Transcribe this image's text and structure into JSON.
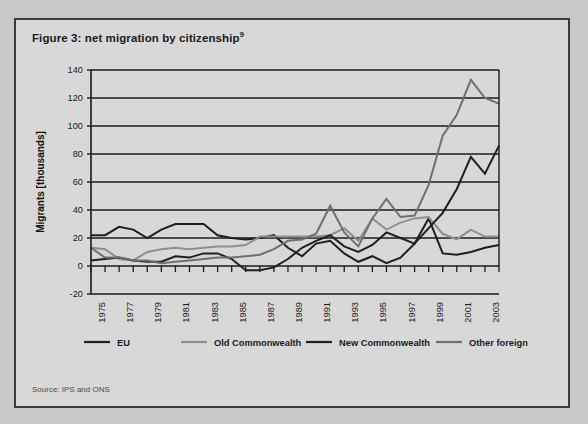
{
  "figure": {
    "title": "Figure 3: net migration by citizenship",
    "title_superscript": "9",
    "source": "Source: IPS and ONS"
  },
  "chart_data": {
    "type": "line",
    "title": "Figure 3: net migration by citizenship",
    "xlabel": "",
    "ylabel": "Migrants [thousands]",
    "ylim": [
      -20,
      140
    ],
    "yticks": [
      -20,
      0,
      20,
      40,
      60,
      80,
      100,
      120,
      140
    ],
    "ytick_labels": [
      "-20",
      "0",
      "20",
      "40",
      "60",
      "80",
      "100",
      "120",
      "140"
    ],
    "xlim": [
      1974,
      2003
    ],
    "x": [
      1974,
      1975,
      1976,
      1977,
      1978,
      1979,
      1980,
      1981,
      1982,
      1983,
      1984,
      1985,
      1986,
      1987,
      1988,
      1989,
      1990,
      1991,
      1992,
      1993,
      1994,
      1995,
      1996,
      1997,
      1998,
      1999,
      2000,
      2001,
      2002,
      2003
    ],
    "xtick_labels": [
      "1975",
      "1977",
      "1979",
      "1981",
      "1983",
      "1985",
      "1987",
      "1989",
      "1991",
      "1993",
      "1995",
      "1997",
      "1999",
      "2001",
      "2003"
    ],
    "xticks": [
      1975,
      1977,
      1979,
      1981,
      1983,
      1985,
      1987,
      1989,
      1991,
      1993,
      1995,
      1997,
      1999,
      2001,
      2003
    ],
    "grid": true,
    "grid_axis": "y",
    "legend_position": "bottom",
    "series": [
      {
        "name": "EU",
        "color": "#1f1f1f",
        "width": 2.0,
        "values": [
          22,
          22,
          28,
          26,
          20,
          26,
          30,
          30,
          30,
          22,
          20,
          19,
          20,
          22,
          13,
          7,
          16,
          18,
          9,
          3,
          7,
          2,
          6,
          16,
          34,
          9,
          8,
          10,
          13,
          15
        ]
      },
      {
        "name": "Old Commonwealth",
        "color": "#8f8f8f",
        "width": 2.0,
        "values": [
          13,
          12,
          5,
          4,
          10,
          12,
          13,
          12,
          13,
          14,
          14,
          15,
          21,
          21,
          21,
          21,
          21,
          22,
          27,
          18,
          34,
          26,
          31,
          34,
          35,
          23,
          19,
          26,
          21,
          21
        ]
      },
      {
        "name": "New Commonwealth",
        "color": "#1f1f1f",
        "width": 2.0,
        "values": [
          4,
          5,
          6,
          4,
          3,
          3,
          7,
          6,
          9,
          9,
          5,
          -3,
          -3,
          -1,
          5,
          13,
          18,
          22,
          14,
          10,
          15,
          24,
          20,
          16,
          27,
          38,
          55,
          78,
          66,
          86
        ]
      },
      {
        "name": "Other foreign",
        "color": "#6f6f6f",
        "width": 2.0,
        "values": [
          13,
          6,
          6,
          4,
          4,
          2,
          3,
          4,
          5,
          6,
          6,
          7,
          8,
          12,
          18,
          19,
          23,
          43,
          24,
          14,
          34,
          48,
          35,
          36,
          58,
          93,
          108,
          133,
          120,
          116
        ]
      }
    ]
  },
  "legend": {
    "items": [
      {
        "label": "EU",
        "color": "#1f1f1f"
      },
      {
        "label": "Old Commonwealth",
        "color": "#8f8f8f"
      },
      {
        "label": "New Commonwealth",
        "color": "#1f1f1f"
      },
      {
        "label": "Other foreign",
        "color": "#6f6f6f"
      }
    ]
  },
  "colors": {
    "page_background": "#c9c9c9",
    "panel_background": "#d8d8d8",
    "panel_border": "#3b3b3b",
    "axis": "#1b1b1b",
    "gridline": "#1b1b1b"
  }
}
